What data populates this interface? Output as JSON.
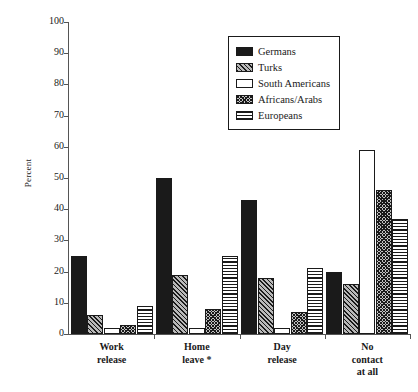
{
  "chart_data": {
    "type": "bar",
    "title": "",
    "xlabel": "",
    "ylabel": "Percent",
    "ylim": [
      0,
      100
    ],
    "yticks": [
      0,
      10,
      20,
      30,
      40,
      50,
      60,
      70,
      80,
      90,
      100
    ],
    "grid": false,
    "legend_position": "top-right",
    "categories": [
      "Work\nrelease",
      "Home\nleave *",
      "Day\nrelease",
      "No\ncontact\nat all"
    ],
    "series": [
      {
        "name": "Germans",
        "pattern": "solid-black",
        "values": [
          25,
          50,
          43,
          20
        ]
      },
      {
        "name": "Turks",
        "pattern": "diagonal-hatch",
        "values": [
          6,
          19,
          18,
          16
        ]
      },
      {
        "name": "South Americans",
        "pattern": "white-empty",
        "values": [
          2,
          2,
          2,
          59
        ]
      },
      {
        "name": "Africans/Arabs",
        "pattern": "dense-cross-hatch",
        "values": [
          3,
          8,
          7,
          46
        ]
      },
      {
        "name": "Europeans",
        "pattern": "horizontal-lines",
        "values": [
          9,
          25,
          21,
          37
        ]
      }
    ],
    "colors": {
      "germans": "#1a1a1a",
      "turks": "#b9b9b9",
      "south_americans": "#ffffff",
      "africans_arabs": "#c2c2c2",
      "europeans": "#ffffff",
      "axis": "#555555",
      "outline": "#1a1a1a",
      "background": "#ffffff"
    }
  },
  "axis": {
    "y_title": "Percent",
    "y_tick_labels": [
      "100",
      "90",
      "80",
      "70",
      "60",
      "50",
      "40",
      "30",
      "20",
      "10",
      "0"
    ]
  },
  "legend": {
    "items": [
      {
        "label": "Germans"
      },
      {
        "label": "Turks"
      },
      {
        "label": "South Americans"
      },
      {
        "label": "Africans/Arabs"
      },
      {
        "label": "Europeans"
      }
    ]
  }
}
